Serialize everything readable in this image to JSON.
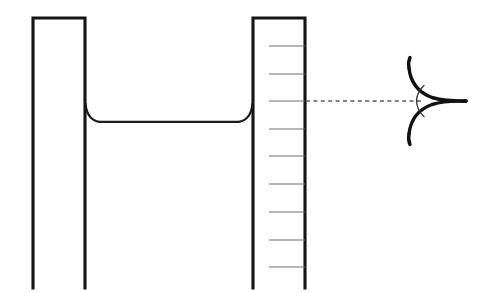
{
  "figure": {
    "canvas": {
      "width": 489,
      "height": 293
    },
    "background_color": "#ffffff",
    "line_color": "#141414",
    "tick_color": "#6e6e6e",
    "dashed_color": "#5b5b5b"
  },
  "left_tube": {
    "name": "left-capillary-tube",
    "left_wall_x": 33,
    "right_wall_x": 85,
    "top_y": 18,
    "bottom_y": 288,
    "closed_top": true,
    "stroke_width": 3.1
  },
  "right_tube": {
    "name": "right-capillary-tube",
    "left_wall_x": 253,
    "right_wall_x": 305,
    "top_y": 18,
    "bottom_y": 288,
    "closed_top": true,
    "stroke_width": 3.1
  },
  "liquid_surface": {
    "name": "liquid-meniscus-surface",
    "flat_level_y": 122,
    "left_contact_x": 85,
    "left_contact_y": 104,
    "right_contact_x": 253,
    "right_contact_y": 104,
    "path": "M 85.5 104 C 86.6 114.2 90.5 120.6 99.5 121.8 L 238.5 121.8 C 247.5 120.6 251.4 114.2 252.5 104",
    "stroke_width": 2.3,
    "description": "concave meniscus, liquid wets both walls and rises at the edges"
  },
  "graduations": {
    "name": "graduation-scale",
    "axis_x": 305,
    "tick_inner_x": 269,
    "tick_values_y": [
      46,
      74,
      101,
      129,
      156,
      184,
      212,
      240,
      267
    ],
    "tick_count": 9,
    "tick_length": 36,
    "stroke_width": 1.05
  },
  "level_line": {
    "name": "reference-level-dashed-line",
    "y": 101,
    "x_start": 306,
    "x_end": 424,
    "dash_pattern": "4 3.4",
    "stroke_width": 1.3
  },
  "detail_inset": {
    "name": "contact-angle-detail",
    "apex_x": 466,
    "apex_y": 101,
    "upper_curve_path": "M 409 68 C 410.5 82 417 92 432 97.5 C 444 101 456 101.2 466 100.6",
    "lower_curve_path": "M 409 134 C 410.5 120 417 110 432 104.5 C 444 101 456 100.8 466 101.4",
    "upper_tail_path": "M 409 68 C 408.2 63.5 408.6 60.5 410 57.5",
    "lower_tail_path": "M 409 134 C 408.2 138.5 408.6 141.5 410 144.5",
    "angle_arc_path": "M 424 85.5 C 418.5 90.5 416.6 96 416.6 101 C 416.6 106 418.5 111.5 424 116.5",
    "stroke_width": 3.4,
    "description": "enlarged view of the meniscus edge forming a cusp with the contact angle marked by an arc"
  }
}
